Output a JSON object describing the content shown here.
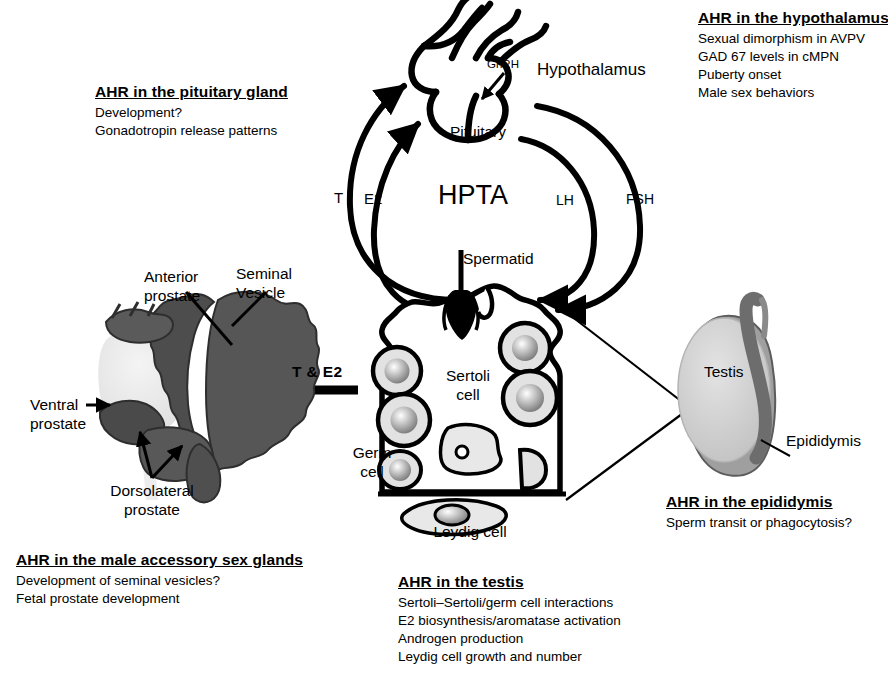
{
  "figure": {
    "center_label": "HPTA"
  },
  "annotations": {
    "hypothalamus": {
      "heading": "AHR in the hypothalamus",
      "lines": [
        "Sexual dimorphism in AVPV",
        "GAD 67 levels in cMPN",
        "Puberty onset",
        "Male sex behaviors"
      ]
    },
    "pituitary": {
      "heading": "AHR in the pituitary gland",
      "lines": [
        "Development?",
        "Gonadotropin release patterns"
      ]
    },
    "accessory_sex_glands": {
      "heading": "AHR in the male accessory sex glands",
      "lines": [
        "Development of seminal vesicles?",
        "Fetal prostate development"
      ]
    },
    "testis": {
      "heading": "AHR in the testis",
      "lines": [
        "Sertoli–Sertoli/germ cell interactions",
        "E2 biosynthesis/aromatase activation",
        "Androgen production",
        "Leydig cell growth and number"
      ]
    },
    "epididymis": {
      "heading": "AHR in the epididymis",
      "lines": [
        "Sperm transit or phagocytosis?"
      ]
    }
  },
  "labels": {
    "hypothalamus": "Hypothalamus",
    "pituitary": "Pituitary",
    "gnrh": "GnRH",
    "t": "T",
    "e2": "E2",
    "lh": "LH",
    "fsh": "FSH",
    "t_and_e2": "T & E2",
    "spermatid": "Spermatid",
    "sertoli_line1": "Sertoli",
    "sertoli_line2": "cell",
    "germ_line1": "Germ",
    "germ_line2": "cell",
    "leydig": "Leydig cell",
    "testis": "Testis",
    "epididymis": "Epididymis",
    "anterior_line1": "Anterior",
    "anterior_line2": "prostate",
    "seminal_line1": "Seminal",
    "seminal_line2": "Vesicle",
    "ventral_line1": "Ventral",
    "ventral_line2": "prostate",
    "dorsolateral_line1": "Dorsolateral",
    "dorsolateral_line2": "prostate"
  },
  "colors": {
    "ink": "#000000",
    "background": "#ffffff",
    "organ_dark": "#6d6d6d",
    "organ_mid": "#9a9a9a",
    "organ_light": "#d3d3d3",
    "organ_pale": "#ededed",
    "cell_fill": "#e2e2e2",
    "nucleus": "#8f8f8f"
  }
}
